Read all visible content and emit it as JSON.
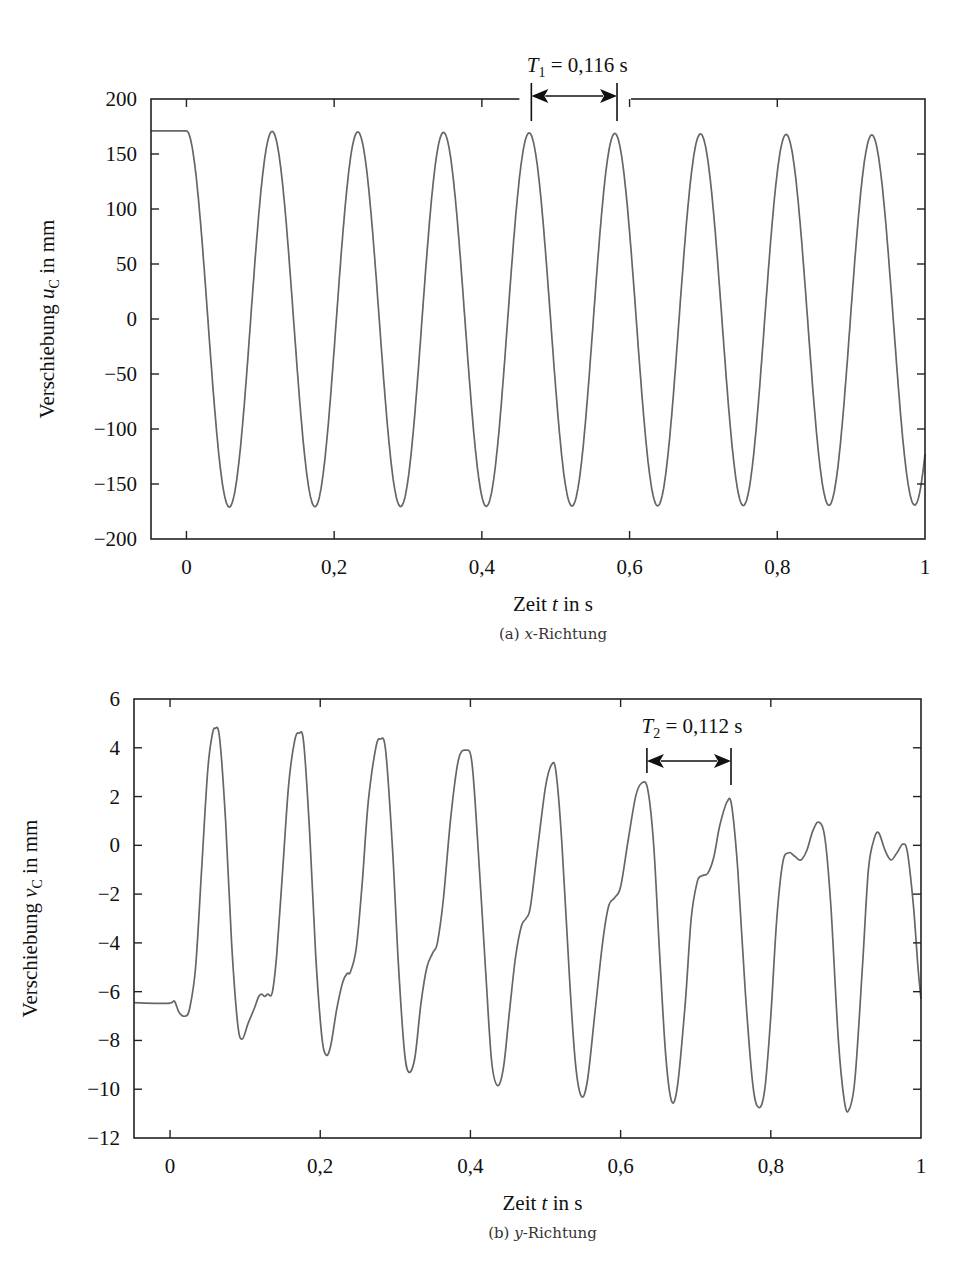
{
  "chart_data": [
    {
      "type": "line",
      "panel": "a",
      "caption": "(a) x-Richtung",
      "caption_prefix": "(a) ",
      "caption_var": "x",
      "caption_suffix": "-Richtung",
      "title": "",
      "xlabel": "Zeit t in s",
      "xlabel_parts": {
        "pre": "Zeit ",
        "var": "t",
        "post": " in s"
      },
      "ylabel": "Verschiebung u_C in mm",
      "ylabel_parts": {
        "pre": "Verschiebung ",
        "var": "u",
        "sub": "C",
        "post": " in mm"
      },
      "xlim": [
        -0.048,
        1.0
      ],
      "ylim": [
        -200,
        200
      ],
      "xticks": [
        0,
        0.2,
        0.4,
        0.6,
        0.8,
        1
      ],
      "xtick_labels": [
        "0",
        "0,2",
        "0,4",
        "0,6",
        "0,8",
        "1"
      ],
      "yticks": [
        200,
        150,
        100,
        50,
        0,
        -50,
        -100,
        -150,
        -200
      ],
      "ytick_labels": [
        "200",
        "150",
        "100",
        "50",
        "0",
        "−50",
        "−100",
        "−150",
        "−200"
      ],
      "grid": false,
      "legend": null,
      "line_color": "#666666",
      "annotation": {
        "label_var": "T",
        "label_sub": "1",
        "label_rest": " = 0,116 s",
        "text": "T1 = 0,116 s",
        "x_start": 0.467,
        "x_end": 0.583
      },
      "series": [
        {
          "name": "u_C",
          "model": "hold then cosine",
          "hold_value": 171,
          "hold_until": 0.0,
          "period": 0.116,
          "amplitude": 171,
          "peaks_t": [
            0.116,
            0.233,
            0.35,
            0.467,
            0.583,
            0.7,
            0.815,
            0.932
          ],
          "peaks_value": [
            170,
            170,
            170,
            169,
            169,
            168,
            168,
            167
          ],
          "troughs_t": [
            0.058,
            0.175,
            0.291,
            0.407,
            0.524,
            0.641,
            0.757,
            0.873,
            0.99
          ],
          "troughs_value": [
            -172,
            -172,
            -172,
            -173,
            -173,
            -173,
            -174,
            -174,
            -175
          ]
        }
      ]
    },
    {
      "type": "line",
      "panel": "b",
      "caption": "(b) y-Richtung",
      "caption_prefix": "(b) ",
      "caption_var": "y",
      "caption_suffix": "-Richtung",
      "title": "",
      "xlabel": "Zeit t in s",
      "xlabel_parts": {
        "pre": "Zeit ",
        "var": "t",
        "post": " in s"
      },
      "ylabel": "Verschiebung v_C in mm",
      "ylabel_parts": {
        "pre": "Verschiebung ",
        "var": "v",
        "sub": "C",
        "post": " in mm"
      },
      "xlim": [
        -0.048,
        1.0
      ],
      "ylim": [
        -12,
        6
      ],
      "xticks": [
        0,
        0.2,
        0.4,
        0.6,
        0.8,
        1
      ],
      "xtick_labels": [
        "0",
        "0,2",
        "0,4",
        "0,6",
        "0,8",
        "1"
      ],
      "yticks": [
        6,
        4,
        2,
        0,
        -2,
        -4,
        -6,
        -8,
        -10,
        -12
      ],
      "ytick_labels": [
        "6",
        "4",
        "2",
        "0",
        "−2",
        "−4",
        "−6",
        "−8",
        "−10",
        "−12"
      ],
      "grid": false,
      "legend": null,
      "line_color": "#666666",
      "annotation": {
        "label_var": "T",
        "label_sub": "2",
        "label_rest": " = 0,112 s",
        "text": "T2 = 0,112 s",
        "x_start": 0.635,
        "x_end": 0.747
      },
      "series": [
        {
          "name": "v_C",
          "points": [
            [
              -0.048,
              -6.45
            ],
            [
              -0.02,
              -6.48
            ],
            [
              0.0,
              -6.47
            ],
            [
              0.006,
              -6.4
            ],
            [
              0.012,
              -6.85
            ],
            [
              0.02,
              -7.0
            ],
            [
              0.026,
              -6.7
            ],
            [
              0.034,
              -5.0
            ],
            [
              0.042,
              -1.0
            ],
            [
              0.05,
              3.0
            ],
            [
              0.056,
              4.5
            ],
            [
              0.06,
              4.8
            ],
            [
              0.066,
              4.4
            ],
            [
              0.074,
              1.0
            ],
            [
              0.082,
              -4.0
            ],
            [
              0.09,
              -7.3
            ],
            [
              0.096,
              -7.95
            ],
            [
              0.104,
              -7.3
            ],
            [
              0.112,
              -6.7
            ],
            [
              0.118,
              -6.2
            ],
            [
              0.122,
              -6.1
            ],
            [
              0.126,
              -6.2
            ],
            [
              0.13,
              -6.1
            ],
            [
              0.136,
              -6.05
            ],
            [
              0.142,
              -4.5
            ],
            [
              0.15,
              -1.0
            ],
            [
              0.158,
              2.5
            ],
            [
              0.166,
              4.3
            ],
            [
              0.172,
              4.6
            ],
            [
              0.178,
              4.2
            ],
            [
              0.186,
              0.5
            ],
            [
              0.194,
              -4.5
            ],
            [
              0.202,
              -7.8
            ],
            [
              0.208,
              -8.6
            ],
            [
              0.214,
              -8.2
            ],
            [
              0.222,
              -6.7
            ],
            [
              0.23,
              -5.6
            ],
            [
              0.236,
              -5.25
            ],
            [
              0.24,
              -5.2
            ],
            [
              0.248,
              -4.2
            ],
            [
              0.256,
              -1.5
            ],
            [
              0.264,
              1.8
            ],
            [
              0.274,
              4.0
            ],
            [
              0.28,
              4.35
            ],
            [
              0.287,
              3.9
            ],
            [
              0.296,
              0.0
            ],
            [
              0.304,
              -4.8
            ],
            [
              0.312,
              -8.4
            ],
            [
              0.318,
              -9.3
            ],
            [
              0.326,
              -8.7
            ],
            [
              0.334,
              -6.5
            ],
            [
              0.342,
              -5.0
            ],
            [
              0.35,
              -4.4
            ],
            [
              0.356,
              -4.0
            ],
            [
              0.364,
              -2.2
            ],
            [
              0.374,
              1.2
            ],
            [
              0.384,
              3.5
            ],
            [
              0.394,
              3.9
            ],
            [
              0.402,
              3.4
            ],
            [
              0.41,
              0.0
            ],
            [
              0.42,
              -5.0
            ],
            [
              0.428,
              -8.8
            ],
            [
              0.436,
              -9.85
            ],
            [
              0.444,
              -9.1
            ],
            [
              0.452,
              -6.8
            ],
            [
              0.46,
              -4.6
            ],
            [
              0.468,
              -3.3
            ],
            [
              0.474,
              -3.0
            ],
            [
              0.48,
              -2.5
            ],
            [
              0.49,
              0.0
            ],
            [
              0.5,
              2.4
            ],
            [
              0.508,
              3.3
            ],
            [
              0.514,
              3.0
            ],
            [
              0.522,
              0.0
            ],
            [
              0.532,
              -5.5
            ],
            [
              0.54,
              -9.0
            ],
            [
              0.548,
              -10.3
            ],
            [
              0.556,
              -9.6
            ],
            [
              0.566,
              -6.8
            ],
            [
              0.576,
              -4.0
            ],
            [
              0.584,
              -2.5
            ],
            [
              0.592,
              -2.15
            ],
            [
              0.6,
              -1.7
            ],
            [
              0.61,
              0.2
            ],
            [
              0.62,
              2.0
            ],
            [
              0.628,
              2.55
            ],
            [
              0.636,
              2.3
            ],
            [
              0.644,
              0.0
            ],
            [
              0.652,
              -4.5
            ],
            [
              0.66,
              -8.6
            ],
            [
              0.668,
              -10.5
            ],
            [
              0.676,
              -9.8
            ],
            [
              0.686,
              -6.5
            ],
            [
              0.694,
              -3.0
            ],
            [
              0.702,
              -1.5
            ],
            [
              0.708,
              -1.25
            ],
            [
              0.716,
              -1.15
            ],
            [
              0.724,
              -0.5
            ],
            [
              0.732,
              0.8
            ],
            [
              0.742,
              1.8
            ],
            [
              0.748,
              1.6
            ],
            [
              0.756,
              -1.0
            ],
            [
              0.766,
              -6.0
            ],
            [
              0.776,
              -9.8
            ],
            [
              0.784,
              -10.75
            ],
            [
              0.792,
              -10.0
            ],
            [
              0.8,
              -7.0
            ],
            [
              0.808,
              -3.0
            ],
            [
              0.816,
              -0.7
            ],
            [
              0.824,
              -0.3
            ],
            [
              0.832,
              -0.45
            ],
            [
              0.84,
              -0.6
            ],
            [
              0.848,
              -0.2
            ],
            [
              0.856,
              0.6
            ],
            [
              0.864,
              0.95
            ],
            [
              0.872,
              0.3
            ],
            [
              0.88,
              -2.5
            ],
            [
              0.89,
              -8.0
            ],
            [
              0.898,
              -10.5
            ],
            [
              0.904,
              -10.85
            ],
            [
              0.912,
              -9.6
            ],
            [
              0.922,
              -5.0
            ],
            [
              0.93,
              -1.0
            ],
            [
              0.938,
              0.3
            ],
            [
              0.944,
              0.5
            ],
            [
              0.952,
              -0.2
            ],
            [
              0.96,
              -0.6
            ],
            [
              0.968,
              -0.3
            ],
            [
              0.976,
              0.05
            ],
            [
              0.982,
              -0.3
            ],
            [
              0.99,
              -2.5
            ],
            [
              0.996,
              -5.0
            ],
            [
              1.0,
              -6.3
            ]
          ],
          "peaks_t": [
            0.06,
            0.172,
            0.28,
            0.394,
            0.508,
            0.628,
            0.748,
            0.864,
            0.944
          ],
          "peaks_value": [
            4.8,
            4.6,
            4.35,
            3.9,
            3.3,
            2.55,
            1.8,
            0.95,
            0.5
          ],
          "troughs_t": [
            0.02,
            0.096,
            0.208,
            0.318,
            0.436,
            0.548,
            0.668,
            0.784,
            0.904
          ],
          "troughs_value": [
            -7.0,
            -7.95,
            -8.6,
            -9.3,
            -9.85,
            -10.3,
            -10.5,
            -10.75,
            -10.85
          ]
        }
      ]
    }
  ]
}
